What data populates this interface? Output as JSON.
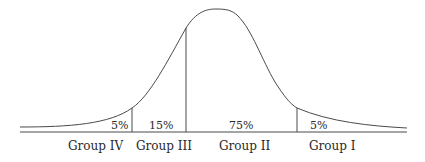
{
  "diagram": {
    "type": "distribution-curve",
    "segments": [
      {
        "group": "Group IV",
        "percent": "5%"
      },
      {
        "group": "Group III",
        "percent": "15%"
      },
      {
        "group": "Group II",
        "percent": "75%"
      },
      {
        "group": "Group I",
        "percent": "5%"
      }
    ]
  },
  "colors": {
    "line": "#4a4a4a",
    "text": "#2a2a2a",
    "background": "#ffffff"
  }
}
